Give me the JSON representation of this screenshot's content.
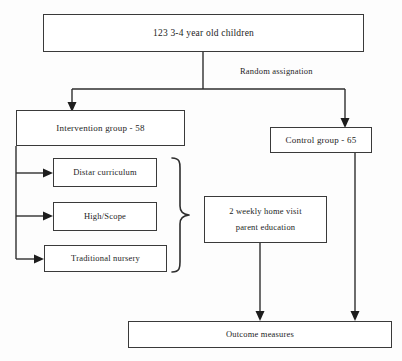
{
  "diagram": {
    "font_color": "#1d1d1d",
    "line_color": "#2e2e2e",
    "box_border_color": "#3a3a3a",
    "background": "#fdfdfd",
    "nodes": {
      "cohort": {
        "text": "123 3-4 year old children",
        "font_size": "9.5px"
      },
      "intervention": {
        "text": "Intervention group - 58",
        "font_size": "9px"
      },
      "control": {
        "text": "Control group - 65",
        "font_size": "9px"
      },
      "distar": {
        "text": "Distar curriculum",
        "font_size": "8.5px"
      },
      "highscope": {
        "text": "High/Scope",
        "font_size": "8.5px"
      },
      "traditional": {
        "text": "Traditional nursery",
        "font_size": "8.5px"
      },
      "homevisit": {
        "line1": "2 weekly home visit",
        "line2": "parent education",
        "font_size": "8.5px"
      },
      "outcome": {
        "text": "Outcome measures",
        "font_size": "8.5px"
      }
    },
    "edge_labels": {
      "randomisation": {
        "text": "Random assignation",
        "font_size": "8.5px"
      }
    }
  }
}
